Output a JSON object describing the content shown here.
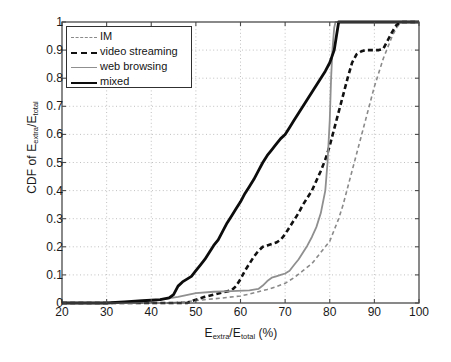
{
  "chart_data": {
    "type": "line",
    "title": "",
    "xlabel": "E_extra/E_total (%)",
    "xlabel_parts": {
      "lead": "E",
      "sub1": "extra",
      "mid": "/E",
      "sub2": "total",
      "tail": " (%)"
    },
    "ylabel": "CDF of E_extra/E_total",
    "ylabel_parts": {
      "lead": "CDF of E",
      "sub1": "extra",
      "mid": "/E",
      "sub2": "total"
    },
    "xlim": [
      20,
      100
    ],
    "ylim": [
      0,
      1
    ],
    "xticks": [
      20,
      30,
      40,
      50,
      60,
      70,
      80,
      90,
      100
    ],
    "xtick_labels": [
      "20",
      "30",
      "40",
      "50",
      "60",
      "70",
      "80",
      "90",
      "100"
    ],
    "yticks": [
      0,
      0.1,
      0.2,
      0.3,
      0.4,
      0.5,
      0.6,
      0.7,
      0.8,
      0.9,
      1
    ],
    "ytick_labels": [
      "0",
      "0.1",
      "0.2",
      "0.3",
      "0.4",
      "0.5",
      "0.6",
      "0.7",
      "0.8",
      "0.9",
      "1"
    ],
    "grid": true,
    "grid_style": "dotted",
    "grid_color": "#b9b9b9",
    "legend_position": "top-left",
    "series": [
      {
        "name": "IM",
        "style": "dashed",
        "color": "#8a8a8a",
        "width": 1.6,
        "points": [
          [
            20,
            0
          ],
          [
            44,
            0
          ],
          [
            48,
            0.005
          ],
          [
            52,
            0.012
          ],
          [
            56,
            0.018
          ],
          [
            60,
            0.025
          ],
          [
            62,
            0.032
          ],
          [
            64,
            0.04
          ],
          [
            66,
            0.048
          ],
          [
            68,
            0.058
          ],
          [
            70,
            0.07
          ],
          [
            72,
            0.09
          ],
          [
            74,
            0.115
          ],
          [
            76,
            0.14
          ],
          [
            77,
            0.16
          ],
          [
            78,
            0.18
          ],
          [
            79,
            0.2
          ],
          [
            80,
            0.22
          ],
          [
            81,
            0.26
          ],
          [
            82,
            0.3
          ],
          [
            83,
            0.35
          ],
          [
            84,
            0.41
          ],
          [
            85,
            0.47
          ],
          [
            86,
            0.53
          ],
          [
            87,
            0.59
          ],
          [
            88,
            0.65
          ],
          [
            89,
            0.71
          ],
          [
            90,
            0.77
          ],
          [
            91,
            0.82
          ],
          [
            92,
            0.87
          ],
          [
            93,
            0.91
          ],
          [
            94,
            0.95
          ],
          [
            95,
            0.98
          ],
          [
            96,
            1.0
          ],
          [
            100,
            1.0
          ]
        ]
      },
      {
        "name": "video streaming",
        "style": "dashed",
        "color": "#111111",
        "width": 2.6,
        "points": [
          [
            20,
            0
          ],
          [
            48,
            0
          ],
          [
            50,
            0.012
          ],
          [
            52,
            0.022
          ],
          [
            54,
            0.03
          ],
          [
            56,
            0.038
          ],
          [
            58,
            0.045
          ],
          [
            59,
            0.06
          ],
          [
            60,
            0.085
          ],
          [
            61,
            0.115
          ],
          [
            62,
            0.14
          ],
          [
            63,
            0.165
          ],
          [
            64,
            0.185
          ],
          [
            65,
            0.2
          ],
          [
            66,
            0.205
          ],
          [
            67,
            0.21
          ],
          [
            68,
            0.215
          ],
          [
            69,
            0.225
          ],
          [
            70,
            0.245
          ],
          [
            71,
            0.27
          ],
          [
            72,
            0.295
          ],
          [
            73,
            0.32
          ],
          [
            74,
            0.35
          ],
          [
            75,
            0.375
          ],
          [
            76,
            0.4
          ],
          [
            77,
            0.435
          ],
          [
            78,
            0.47
          ],
          [
            79,
            0.51
          ],
          [
            80,
            0.56
          ],
          [
            81,
            0.62
          ],
          [
            82,
            0.68
          ],
          [
            83,
            0.74
          ],
          [
            84,
            0.8
          ],
          [
            85,
            0.855
          ],
          [
            86,
            0.885
          ],
          [
            87,
            0.895
          ],
          [
            88,
            0.9
          ],
          [
            90,
            0.9
          ],
          [
            91,
            0.9
          ],
          [
            92,
            0.905
          ],
          [
            93,
            0.935
          ],
          [
            94,
            0.965
          ],
          [
            95,
            0.99
          ],
          [
            96,
            1.0
          ],
          [
            100,
            1.0
          ]
        ]
      },
      {
        "name": "web browsing",
        "style": "solid",
        "color": "#8f8f8f",
        "width": 1.8,
        "points": [
          [
            20,
            0
          ],
          [
            36,
            0
          ],
          [
            38,
            0.005
          ],
          [
            42,
            0.012
          ],
          [
            46,
            0.022
          ],
          [
            50,
            0.035
          ],
          [
            54,
            0.04
          ],
          [
            58,
            0.042
          ],
          [
            62,
            0.045
          ],
          [
            64,
            0.05
          ],
          [
            65,
            0.062
          ],
          [
            66,
            0.078
          ],
          [
            67,
            0.09
          ],
          [
            68,
            0.095
          ],
          [
            69,
            0.1
          ],
          [
            70,
            0.105
          ],
          [
            71,
            0.115
          ],
          [
            72,
            0.135
          ],
          [
            73,
            0.155
          ],
          [
            74,
            0.18
          ],
          [
            75,
            0.205
          ],
          [
            76,
            0.235
          ],
          [
            77,
            0.27
          ],
          [
            78,
            0.32
          ],
          [
            79,
            0.4
          ],
          [
            79.5,
            0.5
          ],
          [
            80,
            0.65
          ],
          [
            80.3,
            0.8
          ],
          [
            80.6,
            0.9
          ],
          [
            81,
            0.98
          ],
          [
            81.3,
            1.0
          ],
          [
            100,
            1.0
          ]
        ]
      },
      {
        "name": "mixed",
        "style": "solid",
        "color": "#0c0c0c",
        "width": 2.8,
        "points": [
          [
            20,
            0
          ],
          [
            30,
            0
          ],
          [
            34,
            0.004
          ],
          [
            38,
            0.008
          ],
          [
            42,
            0.012
          ],
          [
            44,
            0.018
          ],
          [
            45,
            0.03
          ],
          [
            46,
            0.06
          ],
          [
            47,
            0.075
          ],
          [
            48,
            0.085
          ],
          [
            49,
            0.095
          ],
          [
            50,
            0.115
          ],
          [
            51,
            0.135
          ],
          [
            52,
            0.155
          ],
          [
            53,
            0.18
          ],
          [
            54,
            0.205
          ],
          [
            55,
            0.225
          ],
          [
            56,
            0.255
          ],
          [
            57,
            0.285
          ],
          [
            58,
            0.31
          ],
          [
            59,
            0.335
          ],
          [
            60,
            0.36
          ],
          [
            61,
            0.39
          ],
          [
            62,
            0.415
          ],
          [
            63,
            0.44
          ],
          [
            64,
            0.47
          ],
          [
            65,
            0.5
          ],
          [
            66,
            0.525
          ],
          [
            67,
            0.545
          ],
          [
            68,
            0.565
          ],
          [
            69,
            0.585
          ],
          [
            70,
            0.6
          ],
          [
            71,
            0.625
          ],
          [
            72,
            0.65
          ],
          [
            73,
            0.675
          ],
          [
            74,
            0.7
          ],
          [
            75,
            0.725
          ],
          [
            76,
            0.75
          ],
          [
            77,
            0.775
          ],
          [
            78,
            0.8
          ],
          [
            79,
            0.825
          ],
          [
            80,
            0.855
          ],
          [
            81,
            0.9
          ],
          [
            81.5,
            0.95
          ],
          [
            82,
            1.0
          ],
          [
            100,
            1.0
          ]
        ]
      }
    ]
  },
  "legend": {
    "items": [
      {
        "label": "IM",
        "key": "im"
      },
      {
        "label": "video streaming",
        "key": "vs"
      },
      {
        "label": "web browsing",
        "key": "wb"
      },
      {
        "label": "mixed",
        "key": "mx"
      }
    ]
  }
}
